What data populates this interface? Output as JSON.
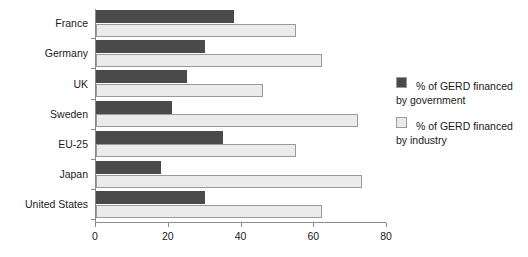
{
  "chart_data": {
    "type": "bar",
    "orientation": "horizontal",
    "title": "",
    "xlabel": "",
    "ylabel": "",
    "xlim": [
      0,
      80
    ],
    "xticks": [
      0,
      20,
      40,
      60,
      80
    ],
    "grid": false,
    "legend_position": "right",
    "categories": [
      "France",
      "Germany",
      "UK",
      "Sweden",
      "EU-25",
      "Japan",
      "United States"
    ],
    "series": [
      {
        "name": "% of GERD financed by government",
        "color": "#4a4a4a",
        "values": [
          38,
          30,
          25,
          21,
          35,
          18,
          30
        ]
      },
      {
        "name": "% of GERD financed by industry",
        "color": "#ebebeb",
        "values": [
          55,
          62,
          46,
          72,
          55,
          73,
          62
        ]
      }
    ]
  },
  "legend": {
    "items": [
      {
        "line1": "% of GERD financed",
        "line2": "by government",
        "swatch": "gov"
      },
      {
        "line1": "% of GERD financed",
        "line2": "by industry",
        "swatch": "ind"
      }
    ]
  }
}
